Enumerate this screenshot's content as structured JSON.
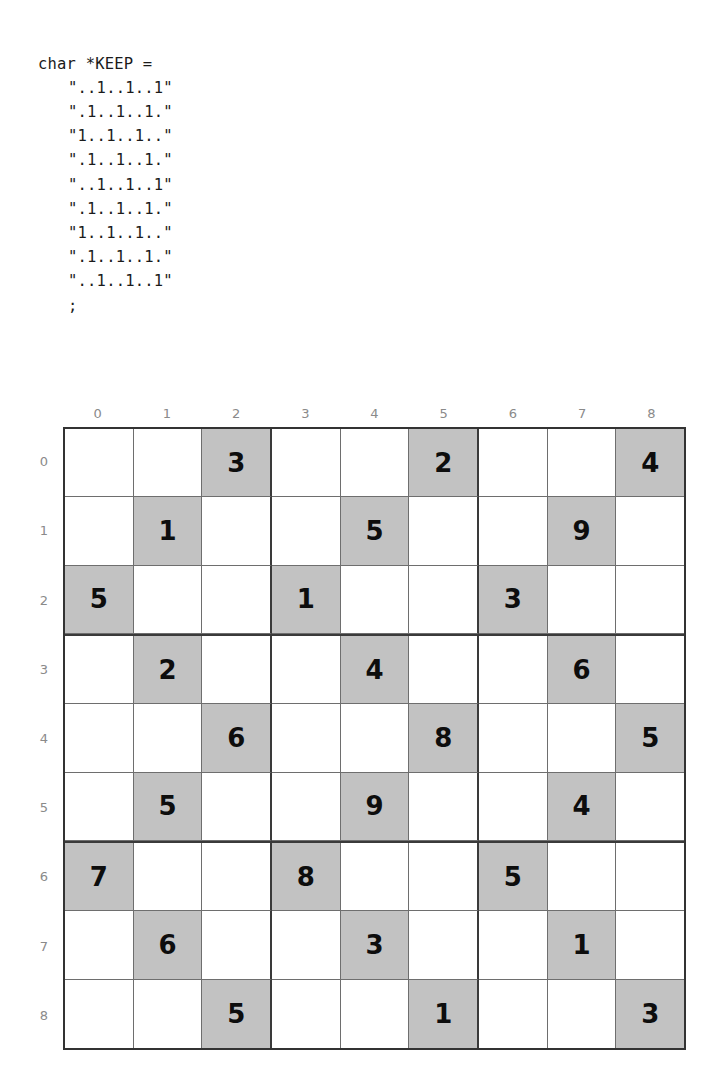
{
  "code": {
    "language": "c",
    "lines": [
      "char *KEEP =",
      "\"..1..1..1\"",
      "\".1..1..1.\"",
      "\"1..1..1..\"",
      "\".1..1..1.\"",
      "\"..1..1..1\"",
      "\".1..1..1.\"",
      "\"1..1..1..\"",
      "\".1..1..1.\"",
      "\"..1..1..1\"",
      ";"
    ]
  },
  "grid": {
    "size": 9,
    "column_headers": [
      "0",
      "1",
      "2",
      "3",
      "4",
      "5",
      "6",
      "7",
      "8"
    ],
    "row_headers": [
      "0",
      "1",
      "2",
      "3",
      "4",
      "5",
      "6",
      "7",
      "8"
    ],
    "block_size": 3,
    "colors": {
      "shaded_cell": "#c2c2c2",
      "empty_cell": "#ffffff",
      "thin_line": "#6e6e6e",
      "thick_line": "#3a3a3a",
      "digit": "#0d0d0d",
      "header_label": "#8a8a8a"
    },
    "rows": [
      [
        {
          "value": "",
          "shaded": false
        },
        {
          "value": "",
          "shaded": false
        },
        {
          "value": "3",
          "shaded": true
        },
        {
          "value": "",
          "shaded": false
        },
        {
          "value": "",
          "shaded": false
        },
        {
          "value": "2",
          "shaded": true
        },
        {
          "value": "",
          "shaded": false
        },
        {
          "value": "",
          "shaded": false
        },
        {
          "value": "4",
          "shaded": true
        }
      ],
      [
        {
          "value": "",
          "shaded": false
        },
        {
          "value": "1",
          "shaded": true
        },
        {
          "value": "",
          "shaded": false
        },
        {
          "value": "",
          "shaded": false
        },
        {
          "value": "5",
          "shaded": true
        },
        {
          "value": "",
          "shaded": false
        },
        {
          "value": "",
          "shaded": false
        },
        {
          "value": "9",
          "shaded": true
        },
        {
          "value": "",
          "shaded": false
        }
      ],
      [
        {
          "value": "5",
          "shaded": true
        },
        {
          "value": "",
          "shaded": false
        },
        {
          "value": "",
          "shaded": false
        },
        {
          "value": "1",
          "shaded": true
        },
        {
          "value": "",
          "shaded": false
        },
        {
          "value": "",
          "shaded": false
        },
        {
          "value": "3",
          "shaded": true
        },
        {
          "value": "",
          "shaded": false
        },
        {
          "value": "",
          "shaded": false
        }
      ],
      [
        {
          "value": "",
          "shaded": false
        },
        {
          "value": "2",
          "shaded": true
        },
        {
          "value": "",
          "shaded": false
        },
        {
          "value": "",
          "shaded": false
        },
        {
          "value": "4",
          "shaded": true
        },
        {
          "value": "",
          "shaded": false
        },
        {
          "value": "",
          "shaded": false
        },
        {
          "value": "6",
          "shaded": true
        },
        {
          "value": "",
          "shaded": false
        }
      ],
      [
        {
          "value": "",
          "shaded": false
        },
        {
          "value": "",
          "shaded": false
        },
        {
          "value": "6",
          "shaded": true
        },
        {
          "value": "",
          "shaded": false
        },
        {
          "value": "",
          "shaded": false
        },
        {
          "value": "8",
          "shaded": true
        },
        {
          "value": "",
          "shaded": false
        },
        {
          "value": "",
          "shaded": false
        },
        {
          "value": "5",
          "shaded": true
        }
      ],
      [
        {
          "value": "",
          "shaded": false
        },
        {
          "value": "5",
          "shaded": true
        },
        {
          "value": "",
          "shaded": false
        },
        {
          "value": "",
          "shaded": false
        },
        {
          "value": "9",
          "shaded": true
        },
        {
          "value": "",
          "shaded": false
        },
        {
          "value": "",
          "shaded": false
        },
        {
          "value": "4",
          "shaded": true
        },
        {
          "value": "",
          "shaded": false
        }
      ],
      [
        {
          "value": "7",
          "shaded": true
        },
        {
          "value": "",
          "shaded": false
        },
        {
          "value": "",
          "shaded": false
        },
        {
          "value": "8",
          "shaded": true
        },
        {
          "value": "",
          "shaded": false
        },
        {
          "value": "",
          "shaded": false
        },
        {
          "value": "5",
          "shaded": true
        },
        {
          "value": "",
          "shaded": false
        },
        {
          "value": "",
          "shaded": false
        }
      ],
      [
        {
          "value": "",
          "shaded": false
        },
        {
          "value": "6",
          "shaded": true
        },
        {
          "value": "",
          "shaded": false
        },
        {
          "value": "",
          "shaded": false
        },
        {
          "value": "3",
          "shaded": true
        },
        {
          "value": "",
          "shaded": false
        },
        {
          "value": "",
          "shaded": false
        },
        {
          "value": "1",
          "shaded": true
        },
        {
          "value": "",
          "shaded": false
        }
      ],
      [
        {
          "value": "",
          "shaded": false
        },
        {
          "value": "",
          "shaded": false
        },
        {
          "value": "5",
          "shaded": true
        },
        {
          "value": "",
          "shaded": false
        },
        {
          "value": "",
          "shaded": false
        },
        {
          "value": "1",
          "shaded": true
        },
        {
          "value": "",
          "shaded": false
        },
        {
          "value": "",
          "shaded": false
        },
        {
          "value": "3",
          "shaded": true
        }
      ]
    ]
  }
}
